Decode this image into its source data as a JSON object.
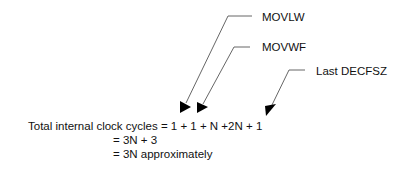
{
  "diagram": {
    "callouts": [
      {
        "id": "movlw",
        "label": "MOVLW"
      },
      {
        "id": "movwf",
        "label": "MOVWF"
      },
      {
        "id": "decfsz",
        "label": "Last DECFSZ"
      }
    ],
    "equation": {
      "line1": "Total internal clock cycles = 1 + 1 + N +2N + 1",
      "line2": "= 3N + 3",
      "line3": "= 3N approximately"
    },
    "colors": {
      "line": "#555555",
      "arrowhead": "#000000",
      "text": "#111111"
    }
  }
}
